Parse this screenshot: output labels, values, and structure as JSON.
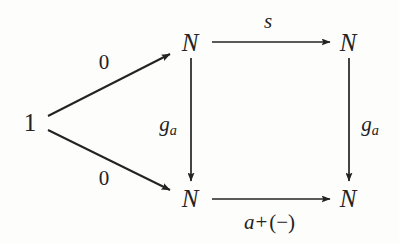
{
  "diagram": {
    "kind": "commutative-diagram",
    "background_color": "#fdfdfc",
    "ink_color": "#232323",
    "nodes": [
      {
        "id": "source",
        "label": "1",
        "x": 30,
        "y": 122,
        "style": "upright"
      },
      {
        "id": "top-left",
        "label": "N",
        "x": 190,
        "y": 42,
        "style": "italic"
      },
      {
        "id": "top-right",
        "label": "N",
        "x": 348,
        "y": 42,
        "style": "italic"
      },
      {
        "id": "bottom-left",
        "label": "N",
        "x": 190,
        "y": 198,
        "style": "italic"
      },
      {
        "id": "bottom-right",
        "label": "N",
        "x": 348,
        "y": 198,
        "style": "italic"
      }
    ],
    "edges": [
      {
        "id": "zero-upper",
        "from": "source",
        "to": "top-left",
        "label": "0",
        "label_style": "upright",
        "label_x": 104,
        "label_y": 62,
        "x1": 48,
        "y1": 116,
        "x2": 170,
        "y2": 54
      },
      {
        "id": "zero-lower",
        "from": "source",
        "to": "bottom-left",
        "label": "0",
        "label_style": "upright",
        "label_x": 104,
        "label_y": 178,
        "x1": 48,
        "y1": 130,
        "x2": 170,
        "y2": 190
      },
      {
        "id": "successor-top",
        "from": "top-left",
        "to": "top-right",
        "label": "s",
        "label_style": "italic",
        "label_x": 268,
        "label_y": 21,
        "x1": 212,
        "y1": 42,
        "x2": 330,
        "y2": 42
      },
      {
        "id": "g-a-left",
        "from": "top-left",
        "to": "bottom-left",
        "label": "g",
        "label_sub": "a",
        "label_style": "italic",
        "label_x": 168,
        "label_y": 126,
        "x1": 191,
        "y1": 58,
        "x2": 191,
        "y2": 181
      },
      {
        "id": "g-a-right",
        "from": "top-right",
        "to": "bottom-right",
        "label": "g",
        "label_sub": "a",
        "label_style": "italic",
        "label_x": 370,
        "label_y": 126,
        "x1": 349,
        "y1": 58,
        "x2": 349,
        "y2": 181
      },
      {
        "id": "addition-bottom",
        "from": "bottom-left",
        "to": "bottom-right",
        "label": "a",
        "label_op": "+",
        "label_tail": "(−)",
        "label_style": "italic",
        "label_x": 270,
        "label_y": 222,
        "x1": 212,
        "y1": 199,
        "x2": 330,
        "y2": 199
      }
    ]
  }
}
